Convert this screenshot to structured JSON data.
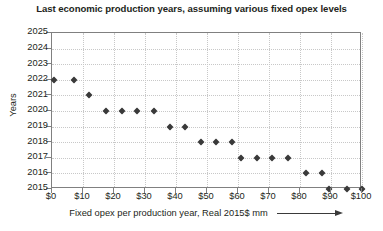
{
  "chart_data": {
    "type": "scatter",
    "title": "Last economic production years, assuming various fixed opex levels",
    "xlabel": "Fixed opex per production year, Real 2015$ mm",
    "ylabel": "Years",
    "xlim": [
      0,
      100
    ],
    "ylim": [
      2015,
      2025
    ],
    "xticks": [
      0,
      10,
      20,
      30,
      40,
      50,
      60,
      70,
      80,
      90,
      100
    ],
    "xticklabels": [
      "$0",
      "$10",
      "$20",
      "$30",
      "$40",
      "$50",
      "$60",
      "$70",
      "$80",
      "$90",
      "$100"
    ],
    "yticks": [
      2015,
      2016,
      2017,
      2018,
      2019,
      2020,
      2021,
      2022,
      2023,
      2024,
      2025
    ],
    "yticklabels": [
      "2015",
      "2016",
      "2017",
      "2018",
      "2019",
      "2020",
      "2021",
      "2022",
      "2023",
      "2024",
      "2025"
    ],
    "grid": true,
    "legend": false,
    "marker": "diamond",
    "marker_color": "#3a3a3a",
    "x": [
      0.5,
      7,
      12,
      17.5,
      22.5,
      27.5,
      33,
      38,
      43,
      48,
      53,
      58,
      61,
      66,
      71,
      76,
      82,
      87,
      89.5,
      95,
      100
    ],
    "y": [
      2022,
      2022,
      2021,
      2020,
      2020,
      2020,
      2020,
      2019,
      2019,
      2018,
      2018,
      2018,
      2017,
      2017,
      2017,
      2017,
      2016,
      2016,
      2015,
      2015,
      2015
    ],
    "points": [
      {
        "x": 0.5,
        "y": 2022
      },
      {
        "x": 7,
        "y": 2022
      },
      {
        "x": 12,
        "y": 2021
      },
      {
        "x": 17.5,
        "y": 2020
      },
      {
        "x": 22.5,
        "y": 2020
      },
      {
        "x": 27.5,
        "y": 2020
      },
      {
        "x": 33,
        "y": 2020
      },
      {
        "x": 38,
        "y": 2019
      },
      {
        "x": 43,
        "y": 2019
      },
      {
        "x": 48,
        "y": 2018
      },
      {
        "x": 53,
        "y": 2018
      },
      {
        "x": 58,
        "y": 2018
      },
      {
        "x": 61,
        "y": 2017
      },
      {
        "x": 66,
        "y": 2017
      },
      {
        "x": 71,
        "y": 2017
      },
      {
        "x": 76,
        "y": 2017
      },
      {
        "x": 82,
        "y": 2016
      },
      {
        "x": 87,
        "y": 2016
      },
      {
        "x": 89.5,
        "y": 2015
      },
      {
        "x": 95,
        "y": 2015
      },
      {
        "x": 100,
        "y": 2015
      }
    ],
    "colors": {
      "marker": "#3a3a3a",
      "axis": "#808080",
      "grid": "#c8c8c8",
      "text": "#231f20",
      "background": "#ffffff"
    }
  }
}
